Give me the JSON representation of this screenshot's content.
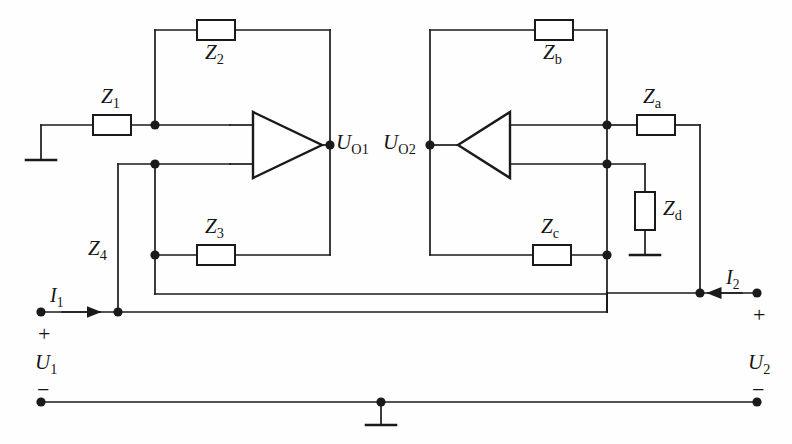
{
  "diagram": {
    "stroke_color": "#1a1a1a",
    "background": "#fefefe",
    "components": {
      "z1": {
        "label": "Z",
        "sub": "1",
        "type": "resistor",
        "orientation": "horizontal"
      },
      "z2": {
        "label": "Z",
        "sub": "2",
        "type": "resistor",
        "orientation": "horizontal"
      },
      "z3": {
        "label": "Z",
        "sub": "3",
        "type": "resistor",
        "orientation": "horizontal"
      },
      "z4": {
        "label": "Z",
        "sub": "4",
        "type": "wire-branch",
        "orientation": "vertical"
      },
      "za": {
        "label": "Z",
        "sub": "a",
        "type": "resistor",
        "orientation": "horizontal"
      },
      "zb": {
        "label": "Z",
        "sub": "b",
        "type": "resistor",
        "orientation": "horizontal"
      },
      "zc": {
        "label": "Z",
        "sub": "c",
        "type": "resistor",
        "orientation": "horizontal"
      },
      "zd": {
        "label": "Z",
        "sub": "d",
        "type": "resistor",
        "orientation": "vertical"
      }
    },
    "amplifiers": [
      {
        "name": "op-amp-1",
        "output_label": "U",
        "output_sub": "O1",
        "direction": "right"
      },
      {
        "name": "op-amp-2",
        "output_label": "U",
        "output_sub": "O2",
        "direction": "left"
      }
    ],
    "ports": {
      "input": {
        "current": "I",
        "current_sub": "1",
        "voltage": "U",
        "voltage_sub": "1",
        "plus": "+",
        "minus": "−"
      },
      "output": {
        "current": "I",
        "current_sub": "2",
        "voltage": "U",
        "voltage_sub": "2",
        "plus": "+",
        "minus": "−"
      }
    },
    "grounds": [
      "ground-left-input",
      "ground-zd",
      "ground-bottom-rail"
    ]
  }
}
